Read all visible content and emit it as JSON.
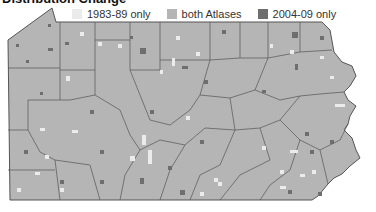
{
  "title": "Distribution Change",
  "legend": [
    {
      "label": "1983-89 only",
      "color": "#ebebeb"
    },
    {
      "label": "both Atlases",
      "color": "#b5b5b5"
    },
    {
      "label": "2004-09 only",
      "color": "#6e6e6e"
    }
  ],
  "map": {
    "region": "Pennsylvania",
    "fill_color": "#b5b5b5",
    "border_color": "#555555",
    "units": "atlas blocks by county"
  }
}
